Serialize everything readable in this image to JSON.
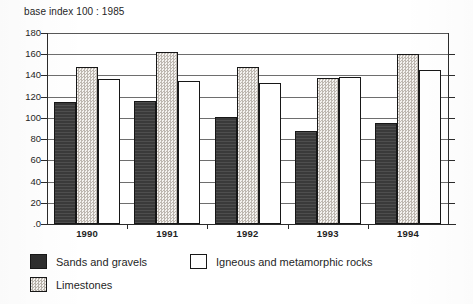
{
  "chart_data": {
    "type": "bar",
    "title": "base index 100 : 1985",
    "xlabel": "",
    "ylabel": "",
    "categories": [
      "1990",
      "1991",
      "1992",
      "1993",
      "1994"
    ],
    "series": [
      {
        "name": "Sands and gravels",
        "values": [
          115,
          116,
          101,
          88,
          95
        ],
        "fill": "solid-dark",
        "color": "#3a3a3a"
      },
      {
        "name": "Limestones",
        "values": [
          148,
          162,
          148,
          138,
          160
        ],
        "fill": "stippled",
        "color": "#ddd9d4"
      },
      {
        "name": "Igneous and metamorphic rocks",
        "values": [
          137,
          135,
          133,
          139,
          145
        ],
        "fill": "white",
        "color": "#ffffff"
      }
    ],
    "ylim": [
      0,
      180
    ],
    "ytick_step": 20,
    "yticks": [
      "180",
      "160",
      "140",
      "120",
      "100",
      "80",
      "60",
      "40",
      "20",
      ".0"
    ],
    "grid": true,
    "legend_position": "bottom-left"
  },
  "legend": {
    "items": [
      {
        "label": "Sands and gravels",
        "swatch": "solid-dark"
      },
      {
        "label": "Igneous and metamorphic rocks",
        "swatch": "white"
      },
      {
        "label": "Limestones",
        "swatch": "stippled"
      }
    ]
  }
}
